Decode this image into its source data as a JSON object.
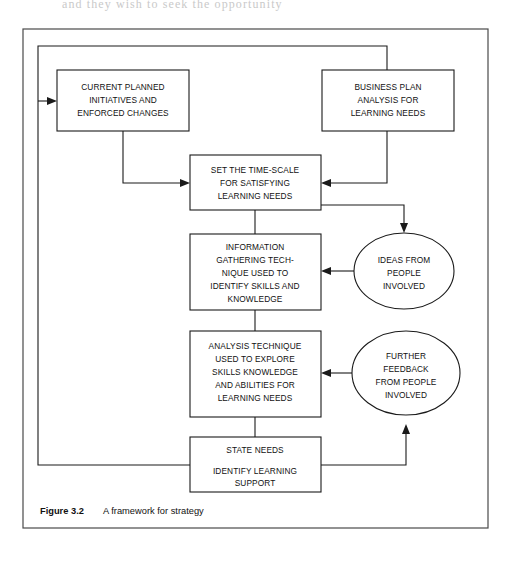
{
  "figure": {
    "caption_label": "Figure 3.2",
    "caption_text": "A framework for strategy",
    "page_bleed_text": "and they wish to seek the opportunity"
  },
  "colors": {
    "ink": "#1a1a1a",
    "frame": "#4a4a4a",
    "paper": "#ffffff"
  },
  "nodes": {
    "current_planned": {
      "id": "current-planned-initiatives",
      "shape": "rect",
      "lines": [
        "CURRENT PLANNED",
        "INITIATIVES AND",
        "ENFORCED CHANGES"
      ]
    },
    "business_plan": {
      "id": "business-plan-analysis",
      "shape": "rect",
      "lines": [
        "BUSINESS PLAN",
        "ANALYSIS FOR",
        "LEARNING NEEDS"
      ]
    },
    "time_scale": {
      "id": "set-time-scale",
      "shape": "rect",
      "lines": [
        "SET THE TIME-SCALE",
        "FOR SATISFYING",
        "LEARNING NEEDS"
      ]
    },
    "information_gathering": {
      "id": "information-gathering-technique",
      "shape": "rect",
      "lines": [
        "INFORMATION",
        "GATHERING TECH-",
        "NIQUE USED TO",
        "IDENTIFY SKILLS AND",
        "KNOWLEDGE"
      ]
    },
    "analysis_technique": {
      "id": "analysis-technique",
      "shape": "rect",
      "lines": [
        "ANALYSIS TECHNIQUE",
        "USED TO EXPLORE",
        "SKILLS KNOWLEDGE",
        "AND ABILITIES FOR",
        "LEARNING NEEDS"
      ]
    },
    "state_needs": {
      "id": "state-needs",
      "shape": "rect",
      "lines_top": [
        "STATE NEEDS"
      ],
      "lines_bottom": [
        "IDENTIFY LEARNING",
        "SUPPORT"
      ]
    },
    "ideas_from_people": {
      "id": "ideas-from-people",
      "shape": "ellipse",
      "lines": [
        "IDEAS FROM",
        "PEOPLE",
        "INVOLVED"
      ]
    },
    "further_feedback": {
      "id": "further-feedback-from-people",
      "shape": "ellipse",
      "lines": [
        "FURTHER",
        "FEEDBACK",
        "FROM PEOPLE",
        "INVOLVED"
      ]
    }
  },
  "connections": [
    {
      "id": "state-needs-to-current-planned",
      "from": "state_needs",
      "to": "current_planned"
    },
    {
      "id": "loop-to-business-plan",
      "from": "state_needs",
      "to": "business_plan"
    },
    {
      "id": "current-planned-to-time-scale",
      "from": "current_planned",
      "to": "time_scale"
    },
    {
      "id": "business-plan-to-time-scale",
      "from": "business_plan",
      "to": "time_scale"
    },
    {
      "id": "time-scale-to-information-gathering",
      "from": "time_scale",
      "to": "information_gathering"
    },
    {
      "id": "time-scale-to-ideas",
      "from": "time_scale",
      "to": "ideas_from_people"
    },
    {
      "id": "ideas-to-information-gathering",
      "from": "ideas_from_people",
      "to": "information_gathering"
    },
    {
      "id": "information-gathering-to-analysis",
      "from": "information_gathering",
      "to": "analysis_technique"
    },
    {
      "id": "further-feedback-to-analysis",
      "from": "further_feedback",
      "to": "analysis_technique"
    },
    {
      "id": "analysis-to-state-needs",
      "from": "analysis_technique",
      "to": "state_needs"
    },
    {
      "id": "state-needs-to-further-feedback",
      "from": "state_needs",
      "to": "further_feedback"
    }
  ]
}
